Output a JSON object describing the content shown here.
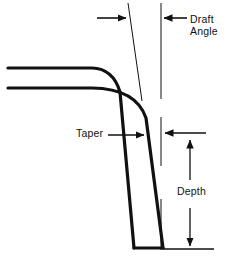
{
  "figure": {
    "type": "engineering-cross-section-diagram",
    "background_color": "#ffffff",
    "line_color": "#111111"
  },
  "labels": {
    "draft_angle": "Draft\nAngle",
    "taper": "Taper",
    "depth": "Depth"
  },
  "geometry": {
    "part_outline": {
      "description": "Two parallel thick lines forming a sheet that runs horizontally then bends down into a tapered wall, closed at the bottom",
      "outer_wall_top_y": 68,
      "inner_wall_top_y": 88,
      "sheet_left_x": 8,
      "bend_start_x": 92,
      "wall_bottom_y": 249,
      "wall_bottom_left_x": 134,
      "wall_bottom_right_x": 163,
      "stroke_width": 3.2
    },
    "draft_reference_line": {
      "description": "Thin slanted line indicating the draft (tilted wall) direction",
      "x1": 128,
      "y1": 3,
      "x2": 142,
      "y2": 101,
      "stroke_width": 1
    },
    "vertical_reference_line": {
      "description": "Thin vertical datum line, drawn as three broken segments",
      "x": 161,
      "segments": [
        [
          3,
          99
        ],
        [
          117,
          166
        ],
        [
          199,
          250
        ]
      ],
      "stroke_width": 1
    },
    "draft_angle_arrow": {
      "description": "Horizontal arrow pointing right at the slanted draft line",
      "from_x": 97,
      "to_x": 127,
      "y": 18
    },
    "draft_angle_leader": {
      "description": "Horizontal arrow pointing left from the Draft Angle text to the vertical datum",
      "from_x": 187,
      "to_x": 163,
      "y": 18
    },
    "taper_leader": {
      "description": "Horizontal arrow pointing right from the Taper text to the tapered wall",
      "from_x": 108,
      "to_x": 145,
      "y": 135
    },
    "depth_top_extension": {
      "description": "Horizontal extension line with left arrowhead marking the top of the depth dimension",
      "from_x": 206,
      "to_x": 164,
      "y": 133
    },
    "depth_bottom_extension": {
      "description": "Horizontal extension line marking the bottom of the depth dimension",
      "from_x": 164,
      "to_x": 214,
      "y": 249
    },
    "depth_dimension_arrows": {
      "description": "Vertical double-ended dimension arrows broken by the Depth text",
      "x": 190,
      "upper_arrow": {
        "tail_y": 180,
        "head_y": 139,
        "direction": "up"
      },
      "lower_arrow": {
        "tail_y": 208,
        "head_y": 247,
        "direction": "down"
      }
    }
  }
}
